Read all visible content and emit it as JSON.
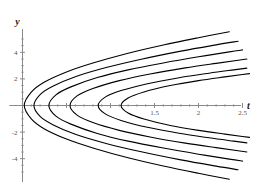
{
  "chart_data": {
    "type": "line",
    "title": "",
    "subtitle": "",
    "xlabel": "t",
    "ylabel": "y",
    "xlim": [
      -0.15,
      2.62
    ],
    "ylim": [
      -5.6,
      5.6
    ],
    "grid": false,
    "legend": null,
    "x_ticks": [
      {
        "value": 0.5,
        "label": ""
      },
      {
        "value": 1.0,
        "label": ""
      },
      {
        "value": 1.5,
        "label": "1.5"
      },
      {
        "value": 2.0,
        "label": "2"
      },
      {
        "value": 2.5,
        "label": "2.5"
      }
    ],
    "y_ticks": [
      {
        "value": -4,
        "label": "-4"
      },
      {
        "value": -2,
        "label": "-2"
      },
      {
        "value": 2,
        "label": "2"
      },
      {
        "value": 4,
        "label": "4"
      }
    ],
    "x_minor_ticks": [
      0.1,
      0.2,
      0.3,
      0.4,
      0.6,
      0.7,
      0.8,
      0.9,
      1.1,
      1.2,
      1.3,
      1.4,
      1.6,
      1.7,
      1.8,
      1.9,
      2.1,
      2.2,
      2.3,
      2.4
    ],
    "y_minor_ticks": [
      -5,
      -4.5,
      -3.5,
      -3,
      -2.5,
      -1.5,
      -1,
      -0.5,
      0.5,
      1,
      1.5,
      2.5,
      3,
      3.5,
      4.5,
      5
    ],
    "curve_color": "#000000",
    "axis_color": "#8a8a8a",
    "series": [
      {
        "name": "c0",
        "vertex_t": 0.02,
        "k": 11.8,
        "upper_points": [
          [
            0.02,
            0
          ],
          [
            0.1,
            1.0
          ],
          [
            0.25,
            1.76
          ],
          [
            0.5,
            2.52
          ],
          [
            0.8,
            3.19
          ],
          [
            1.2,
            3.93
          ],
          [
            1.6,
            4.55
          ],
          [
            2.0,
            5.1
          ],
          [
            2.35,
            5.55
          ]
        ],
        "lower_points": [
          [
            0.02,
            0
          ],
          [
            0.1,
            -1.0
          ],
          [
            0.25,
            -1.76
          ],
          [
            0.5,
            -2.52
          ],
          [
            0.8,
            -3.19
          ],
          [
            1.2,
            -3.93
          ],
          [
            1.6,
            -4.55
          ],
          [
            2.0,
            -5.1
          ],
          [
            2.35,
            -5.55
          ]
        ]
      },
      {
        "name": "c1",
        "vertex_t": 0.13,
        "k": 9.7,
        "upper_points": [
          [
            0.13,
            0
          ],
          [
            0.2,
            0.82
          ],
          [
            0.35,
            1.46
          ],
          [
            0.6,
            2.16
          ],
          [
            0.95,
            2.85
          ],
          [
            1.35,
            3.48
          ],
          [
            1.8,
            4.09
          ],
          [
            2.2,
            4.56
          ],
          [
            2.45,
            4.83
          ]
        ],
        "lower_points": [
          [
            0.13,
            0
          ],
          [
            0.2,
            -0.82
          ],
          [
            0.35,
            -1.46
          ],
          [
            0.6,
            -2.16
          ],
          [
            0.95,
            -2.85
          ],
          [
            1.35,
            -3.48
          ],
          [
            1.8,
            -4.09
          ],
          [
            2.2,
            -4.56
          ],
          [
            2.45,
            -4.83
          ]
        ]
      },
      {
        "name": "c2",
        "vertex_t": 0.3,
        "k": 7.9,
        "upper_points": [
          [
            0.3,
            0
          ],
          [
            0.38,
            0.8
          ],
          [
            0.55,
            1.4
          ],
          [
            0.85,
            2.1
          ],
          [
            1.2,
            2.68
          ],
          [
            1.6,
            3.2
          ],
          [
            2.0,
            3.66
          ],
          [
            2.35,
            4.03
          ],
          [
            2.5,
            4.18
          ]
        ],
        "lower_points": [
          [
            0.3,
            0
          ],
          [
            0.38,
            -0.8
          ],
          [
            0.55,
            -1.4
          ],
          [
            0.85,
            -2.1
          ],
          [
            1.2,
            -2.68
          ],
          [
            1.6,
            -3.2
          ],
          [
            2.0,
            -3.66
          ],
          [
            2.35,
            -4.03
          ],
          [
            2.5,
            -4.18
          ]
        ]
      },
      {
        "name": "c3",
        "vertex_t": 0.54,
        "k": 6.3,
        "upper_points": [
          [
            0.54,
            0
          ],
          [
            0.62,
            0.72
          ],
          [
            0.8,
            1.28
          ],
          [
            1.1,
            1.87
          ],
          [
            1.45,
            2.37
          ],
          [
            1.85,
            2.83
          ],
          [
            2.2,
            3.17
          ],
          [
            2.45,
            3.4
          ],
          [
            2.55,
            3.49
          ]
        ],
        "lower_points": [
          [
            0.54,
            0
          ],
          [
            0.62,
            -0.72
          ],
          [
            0.8,
            -1.28
          ],
          [
            1.1,
            -1.87
          ],
          [
            1.45,
            -2.37
          ],
          [
            1.85,
            -2.83
          ],
          [
            2.2,
            -3.17
          ],
          [
            2.45,
            -3.4
          ],
          [
            2.55,
            -3.49
          ]
        ]
      },
      {
        "name": "c4",
        "vertex_t": 0.86,
        "k": 4.9,
        "upper_points": [
          [
            0.86,
            0
          ],
          [
            0.94,
            0.63
          ],
          [
            1.12,
            1.12
          ],
          [
            1.42,
            1.64
          ],
          [
            1.78,
            2.09
          ],
          [
            2.12,
            2.43
          ],
          [
            2.4,
            2.68
          ],
          [
            2.55,
            2.81
          ]
        ],
        "lower_points": [
          [
            0.86,
            0
          ],
          [
            0.94,
            -0.63
          ],
          [
            1.12,
            -1.12
          ],
          [
            1.42,
            -1.64
          ],
          [
            1.78,
            -2.09
          ],
          [
            2.12,
            -2.43
          ],
          [
            2.4,
            -2.68
          ],
          [
            2.55,
            -2.81
          ]
        ]
      },
      {
        "name": "c5",
        "vertex_t": 1.12,
        "k": 4.1,
        "upper_points": [
          [
            1.12,
            0
          ],
          [
            1.2,
            0.57
          ],
          [
            1.38,
            1.02
          ],
          [
            1.68,
            1.5
          ],
          [
            2.0,
            1.87
          ],
          [
            2.3,
            2.15
          ],
          [
            2.5,
            2.33
          ],
          [
            2.58,
            2.4
          ]
        ],
        "lower_points": [
          [
            1.12,
            0
          ],
          [
            1.2,
            -0.57
          ],
          [
            1.38,
            -1.02
          ],
          [
            1.68,
            -1.5
          ],
          [
            2.0,
            -1.87
          ],
          [
            2.3,
            -2.15
          ],
          [
            2.5,
            -2.33
          ],
          [
            2.58,
            -2.4
          ]
        ]
      }
    ]
  }
}
